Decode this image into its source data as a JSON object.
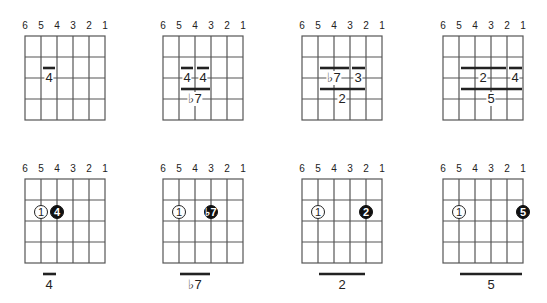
{
  "string_labels": [
    "6",
    "5",
    "4",
    "3",
    "2",
    "1"
  ],
  "colors": {
    "grid": "#555555",
    "bar": "#222222",
    "dot_fill": "#111111",
    "text": "#222222"
  },
  "top_row": [
    {
      "bars": [
        {
          "row": 1.5,
          "from_string": 5,
          "to_string": 4,
          "label": "4"
        }
      ]
    },
    {
      "bars": [
        {
          "row": 1.5,
          "from_string": 5,
          "to_string": 4,
          "label": "4"
        },
        {
          "row": 1.5,
          "from_string": 4,
          "to_string": 3,
          "label": "4"
        },
        {
          "row": 2.5,
          "from_string": 5,
          "to_string": 3,
          "label": "♭7"
        }
      ]
    },
    {
      "bars": [
        {
          "row": 1.5,
          "from_string": 5,
          "to_string": 3,
          "label": "♭7"
        },
        {
          "row": 1.5,
          "from_string": 3,
          "to_string": 2,
          "label": "3"
        },
        {
          "row": 2.5,
          "from_string": 5,
          "to_string": 2,
          "label": "2"
        }
      ]
    },
    {
      "bars": [
        {
          "row": 1.5,
          "from_string": 5,
          "to_string": 2,
          "label": "2"
        },
        {
          "row": 1.5,
          "from_string": 2,
          "to_string": 1,
          "label": "4"
        },
        {
          "row": 2.5,
          "from_string": 5,
          "to_string": 1,
          "label": "5"
        }
      ]
    }
  ],
  "bottom_row": [
    {
      "root": {
        "string": 5,
        "label": "1"
      },
      "target": {
        "string": 4,
        "label": "4"
      },
      "caption": "4"
    },
    {
      "root": {
        "string": 5,
        "label": "1"
      },
      "target": {
        "string": 3,
        "label": "♭7"
      },
      "caption": "♭7"
    },
    {
      "root": {
        "string": 5,
        "label": "1"
      },
      "target": {
        "string": 2,
        "label": "2"
      },
      "caption": "2"
    },
    {
      "root": {
        "string": 5,
        "label": "1"
      },
      "target": {
        "string": 1,
        "label": "5"
      },
      "caption": "5"
    }
  ]
}
